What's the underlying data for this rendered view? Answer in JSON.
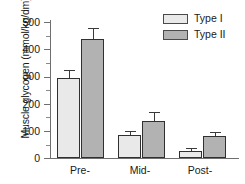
{
  "chart_data": {
    "type": "bar",
    "title": "",
    "xlabel": "",
    "ylabel": "Muscle glycogen (mmol/kg/dm)",
    "categories": [
      "Pre-",
      "Mid-",
      "Post-"
    ],
    "ylim": [
      0,
      525
    ],
    "yticks": [
      0,
      100,
      200,
      300,
      400,
      500
    ],
    "ytick_labels": [
      "0",
      "100",
      "200",
      "300",
      "400",
      "500"
    ],
    "yminor_ticks": [
      50,
      150,
      250,
      350,
      450
    ],
    "grid": false,
    "legend_position": "top-right",
    "series": [
      {
        "name": "Type I",
        "color": "#e9e9e9",
        "values": [
          309,
          88,
          28
        ],
        "errors": [
          28,
          14,
          6
        ]
      },
      {
        "name": "Type II",
        "color": "#b2b2b2",
        "values": [
          460,
          141,
          85
        ],
        "errors": [
          39,
          31,
          12
        ]
      }
    ]
  },
  "axis": {
    "y_title": "Muscle glycogen (mmol/kg/dm)",
    "tick_0": "0",
    "tick_100": "100",
    "tick_200": "200",
    "tick_300": "300",
    "tick_400": "400",
    "tick_500": "500"
  },
  "x_labels": {
    "pre": "Pre-",
    "mid": "Mid-",
    "post": "Post-"
  },
  "legend": {
    "items": [
      {
        "label": "Type I",
        "color": "#e9e9e9"
      },
      {
        "label": "Type II",
        "color": "#b2b2b2"
      }
    ]
  }
}
